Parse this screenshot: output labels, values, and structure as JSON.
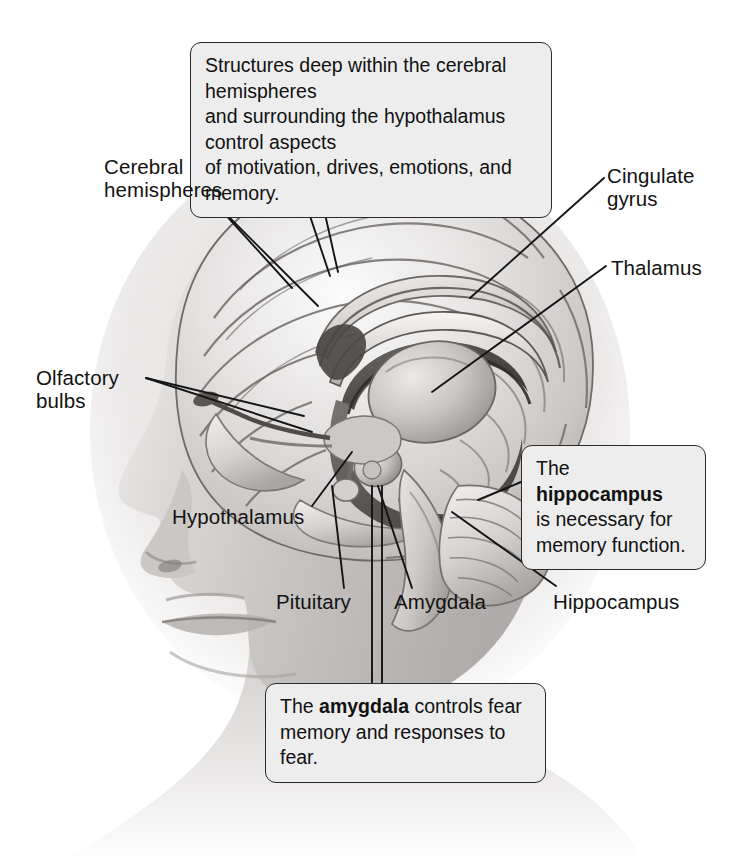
{
  "figure": {
    "background_color": "#ffffff",
    "label_color": "#121212",
    "callout_fill": "#ededed",
    "callout_border": "#2b2b2b",
    "leader_line_color": "#1a1a1a"
  },
  "callouts": [
    {
      "id": "limbic-overview",
      "text": "Structures deep within the cerebral hemispheres\nand surrounding the hypothalamus control aspects\nof motivation, drives, emotions, and memory.",
      "bold_terms": []
    },
    {
      "id": "hippocampus-note",
      "lead": "The ",
      "bold": "hippocampus",
      "tail": "\nis necessary for\nmemory function."
    },
    {
      "id": "amygdala-note",
      "lead": "The ",
      "bold": "amygdala",
      "tail": " controls fear\nmemory and responses to fear."
    }
  ],
  "labels": {
    "cerebral_hemispheres": "Cerebral\nhemispheres",
    "olfactory_bulbs": "Olfactory\nbulbs",
    "hypothalamus": "Hypothalamus",
    "pituitary": "Pituitary",
    "amygdala": "Amygdala",
    "hippocampus": "Hippocampus",
    "cingulate_gyrus": "Cingulate\ngyrus",
    "thalamus": "Thalamus"
  },
  "anatomy_parts": [
    "cerebral cortex",
    "cingulate gyrus",
    "corpus callosum",
    "fornix",
    "thalamus",
    "hypothalamus",
    "pituitary gland",
    "amygdala",
    "hippocampus",
    "olfactory bulb",
    "olfactory tract",
    "brainstem",
    "cerebellum"
  ]
}
